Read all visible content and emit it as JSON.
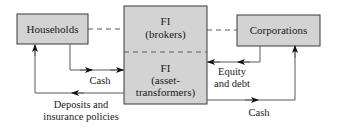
{
  "diagram": {
    "nodes": {
      "households": {
        "label": "Households"
      },
      "fi_brokers": {
        "line1": "FI",
        "line2": "(brokers)"
      },
      "fi_asset_transformers": {
        "line1": "FI",
        "line2": "(asset-",
        "line3": "transformers)"
      },
      "corporations": {
        "label": "Corporations"
      }
    },
    "edges": {
      "households_to_fi_cash": {
        "label": "Cash"
      },
      "fi_to_households_deposits": {
        "line1": "Deposits and",
        "line2": "insurance policies"
      },
      "corporations_to_fi_claims": {
        "line1": "Equity",
        "line2": "and debt"
      },
      "fi_to_corporations_cash": {
        "label": "Cash"
      }
    },
    "colors": {
      "box_fill": "#d3d3d3",
      "box_stroke": "#3a3a3a",
      "line": "#5a5a5a",
      "dashed": "#5a5a5a",
      "text": "#1a1a1a"
    }
  }
}
